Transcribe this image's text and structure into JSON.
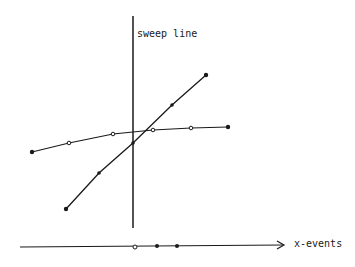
{
  "labels": {
    "sweep_line": "sweep line",
    "x_events": "x-events"
  },
  "segments": [
    {
      "name": "steep-segment",
      "start": [
        66,
        209
      ],
      "end": [
        206,
        75
      ],
      "points": [
        [
          66,
          209,
          "filled"
        ],
        [
          99,
          173,
          "filled"
        ],
        [
          133,
          143,
          "filled"
        ],
        [
          172,
          105,
          "filled"
        ],
        [
          206,
          75,
          "filled"
        ]
      ]
    },
    {
      "name": "shallow-segment",
      "start": [
        32,
        152
      ],
      "end": [
        228,
        127
      ],
      "points": [
        [
          32,
          152,
          "filled"
        ],
        [
          69,
          143,
          "open"
        ],
        [
          113,
          134,
          "open"
        ],
        [
          153,
          130,
          "open"
        ],
        [
          191,
          128,
          "open"
        ],
        [
          228,
          127,
          "filled"
        ]
      ]
    }
  ],
  "sweep_line_x": 133,
  "event_axis": {
    "y": 246,
    "events": [
      [
        135,
        "open"
      ],
      [
        157,
        "filled"
      ],
      [
        177,
        "filled"
      ]
    ]
  },
  "colors": {
    "ink": "#1a1a1a",
    "background": "#ffffff"
  }
}
